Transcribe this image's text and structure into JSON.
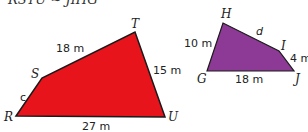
{
  "statement": "RSTU ~ JIHG",
  "figure_left": {
    "name": "RSTU",
    "fill": "#e8141c",
    "vertices": {
      "R": "R",
      "S": "S",
      "T": "T",
      "U": "U"
    },
    "sides": {
      "RS": "c",
      "ST": "18 m",
      "TU": "15 m",
      "RU": "27 m"
    }
  },
  "figure_right": {
    "name": "GHIJ",
    "fill": "#8c3a96",
    "vertices": {
      "G": "G",
      "H": "H",
      "I": "I",
      "J": "J"
    },
    "sides": {
      "GH": "10 m",
      "HI": "d",
      "IJ": "4 m",
      "GJ": "18 m"
    }
  }
}
